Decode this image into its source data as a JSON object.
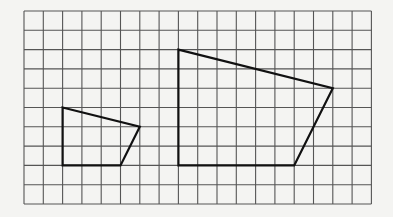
{
  "diagram": {
    "type": "grid-polygons",
    "background": "#f4f4f2",
    "grid": {
      "left": 24,
      "top": 11,
      "cell": 19.3,
      "cols": 18,
      "rows": 10,
      "line_color": "#555555",
      "line_width": 1.1
    },
    "shapes": [
      {
        "name": "small-quadrilateral",
        "points": [
          [
            2,
            5
          ],
          [
            6,
            6
          ],
          [
            5,
            8
          ],
          [
            2,
            8
          ]
        ],
        "stroke": "#111111",
        "stroke_width": 2.2
      },
      {
        "name": "large-quadrilateral",
        "points": [
          [
            8,
            2
          ],
          [
            16,
            4
          ],
          [
            14,
            8
          ],
          [
            8,
            8
          ]
        ],
        "stroke": "#111111",
        "stroke_width": 2.2
      }
    ]
  }
}
